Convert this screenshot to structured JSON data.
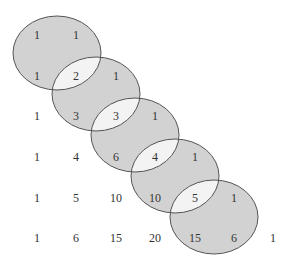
{
  "diagram": {
    "colors": {
      "ellipse_fill": "#d2d2d2",
      "overlap_fill": "#f3f3f3",
      "stroke": "#555555",
      "text": "#333333"
    },
    "ellipses": [
      {
        "cx": 57,
        "cy": 53,
        "rx": 44,
        "ry": 37
      },
      {
        "cx": 96,
        "cy": 94,
        "rx": 44,
        "ry": 37
      },
      {
        "cx": 135,
        "cy": 135,
        "rx": 44,
        "ry": 37
      },
      {
        "cx": 175,
        "cy": 176,
        "rx": 44,
        "ry": 37
      },
      {
        "cx": 214,
        "cy": 217,
        "rx": 44,
        "ry": 37
      }
    ],
    "rows": [
      {
        "y": 39,
        "values": [
          "1",
          "1"
        ]
      },
      {
        "y": 80,
        "values": [
          "1",
          "2",
          "1"
        ]
      },
      {
        "y": 120,
        "values": [
          "1",
          "3",
          "3",
          "1"
        ]
      },
      {
        "y": 161,
        "values": [
          "1",
          "4",
          "6",
          "4",
          "1"
        ]
      },
      {
        "y": 202,
        "values": [
          "1",
          "5",
          "10",
          "10",
          "5",
          "1"
        ]
      },
      {
        "y": 242,
        "values": [
          "1",
          "6",
          "15",
          "20",
          "15",
          "6",
          "1"
        ]
      }
    ],
    "column_x": [
      37,
      76,
      116,
      155,
      195,
      234,
      273
    ]
  }
}
